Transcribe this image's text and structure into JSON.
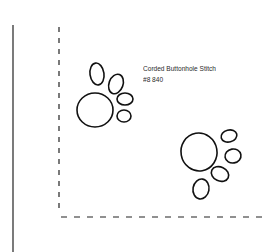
{
  "annotation": {
    "title": "Corded Buttonhole Stitch",
    "thread": "#8 840"
  },
  "colors": {
    "ink": "#111111",
    "background": "#ffffff"
  }
}
